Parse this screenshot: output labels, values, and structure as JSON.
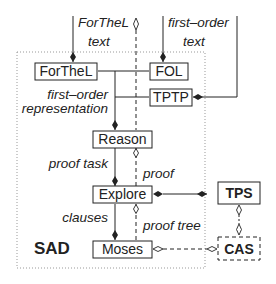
{
  "diagram": {
    "boundary": {
      "label": "SAD"
    },
    "nodes": {
      "forthel": {
        "label": "ForTheL"
      },
      "fol": {
        "label": "FOL"
      },
      "tptp": {
        "label": "TPTP"
      },
      "reason": {
        "label": "Reason"
      },
      "explore": {
        "label": "Explore"
      },
      "moses": {
        "label": "Moses"
      },
      "tps": {
        "label": "TPS"
      },
      "cas": {
        "label": "CAS"
      }
    },
    "edge_labels": {
      "forthel_text_1": "ForTheL",
      "forthel_text_2": "text",
      "fo_text_1": "first–order",
      "fo_text_2": "text",
      "fo_repr_1": "first–order",
      "fo_repr_2": "representation",
      "proof_task": "proof task",
      "proof": "proof",
      "clauses": "clauses",
      "proof_tree": "proof tree"
    },
    "colors": {
      "stroke": "#222222",
      "boundary": "#999999",
      "background": "#ffffff"
    }
  }
}
